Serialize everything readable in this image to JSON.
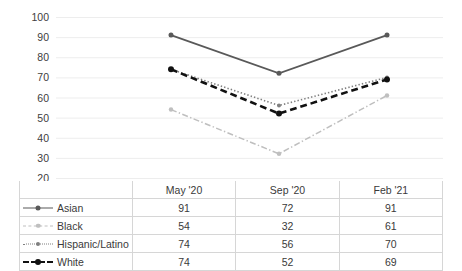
{
  "chart_data": {
    "type": "line",
    "title": "",
    "xlabel": "",
    "ylabel": "",
    "categories": [
      "May '20",
      "Sep '20",
      "Feb '21"
    ],
    "ylim": [
      20,
      100
    ],
    "ytick_step": 10,
    "yticks": [
      100,
      90,
      80,
      70,
      60,
      50,
      40,
      30,
      20
    ],
    "grid": true,
    "legend_position": "table-below",
    "series": [
      {
        "name": "Asian",
        "values": [
          91,
          72,
          91
        ],
        "color": "#595959",
        "line_style": "solid",
        "marker": "circle",
        "marker_size": 5,
        "line_width": 1.7
      },
      {
        "name": "Black",
        "values": [
          54,
          32,
          61
        ],
        "color": "#bfbfbf",
        "line_style": "dash-dot",
        "marker": "circle",
        "marker_size": 4.5,
        "line_width": 1.5
      },
      {
        "name": "Hispanic/Latino",
        "values": [
          74,
          56,
          70
        ],
        "color": "#7f7f7f",
        "line_style": "dotted",
        "marker": "circle",
        "marker_size": 4,
        "line_width": 1.6
      },
      {
        "name": "White",
        "values": [
          74,
          52,
          69
        ],
        "color": "#111111",
        "line_style": "dashed",
        "marker": "circle",
        "marker_size": 6,
        "line_width": 2.6
      }
    ]
  },
  "table": {
    "corner_label": "",
    "column_headers": [
      "May '20",
      "Sep '20",
      "Feb '21"
    ],
    "rows": [
      {
        "label": "Asian",
        "values": [
          "91",
          "72",
          "91"
        ]
      },
      {
        "label": "Black",
        "values": [
          "54",
          "32",
          "61"
        ]
      },
      {
        "label": "Hispanic/Latino",
        "values": [
          "74",
          "56",
          "70"
        ]
      },
      {
        "label": "White",
        "values": [
          "74",
          "52",
          "69"
        ]
      }
    ]
  }
}
